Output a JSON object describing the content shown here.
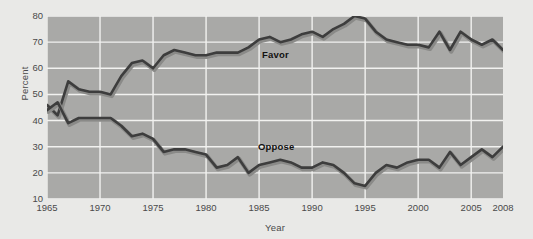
{
  "chart_data": {
    "type": "line",
    "title": "",
    "xlabel": "Year",
    "ylabel": "Percent",
    "xlim": [
      1965,
      2008
    ],
    "ylim": [
      10,
      80
    ],
    "yticks": [
      10,
      20,
      30,
      40,
      50,
      60,
      70,
      80
    ],
    "xticks": [
      1965,
      1970,
      1975,
      1980,
      1985,
      1990,
      1995,
      2000,
      2005,
      2008
    ],
    "grid": true,
    "legend_position": "inline-labels",
    "plot_background": "#a9a9a7",
    "figure_background": "#e9e9e7",
    "line_color": "#3d3d3d",
    "x": [
      1965,
      1966,
      1967,
      1968,
      1969,
      1970,
      1971,
      1972,
      1973,
      1974,
      1975,
      1976,
      1977,
      1978,
      1979,
      1980,
      1981,
      1982,
      1983,
      1984,
      1985,
      1986,
      1987,
      1988,
      1989,
      1990,
      1991,
      1992,
      1993,
      1994,
      1995,
      1996,
      1997,
      1998,
      1999,
      2000,
      2001,
      2002,
      2003,
      2004,
      2005,
      2006,
      2007,
      2008
    ],
    "series": [
      {
        "name": "Favor",
        "label": "Favor",
        "values": [
          46,
          42,
          55,
          52,
          51,
          51,
          50,
          57,
          62,
          63,
          60,
          65,
          67,
          66,
          65,
          65,
          66,
          66,
          66,
          68,
          71,
          72,
          70,
          71,
          73,
          74,
          72,
          75,
          77,
          80,
          79,
          74,
          71,
          70,
          69,
          69,
          68,
          74,
          67,
          74,
          71,
          69,
          71,
          67
        ]
      },
      {
        "name": "Oppose",
        "label": "Oppose",
        "values": [
          44,
          47,
          39,
          41,
          41,
          41,
          41,
          38,
          34,
          35,
          33,
          28,
          29,
          29,
          28,
          27,
          22,
          23,
          26,
          20,
          23,
          24,
          25,
          24,
          22,
          22,
          24,
          23,
          20,
          16,
          15,
          20,
          23,
          22,
          24,
          25,
          25,
          22,
          28,
          23,
          26,
          29,
          26,
          30
        ]
      }
    ],
    "annotations": [
      {
        "text": "Favor",
        "x": 1986,
        "y": 63
      },
      {
        "text": "Oppose",
        "x": 1985.5,
        "y": 28
      }
    ]
  }
}
